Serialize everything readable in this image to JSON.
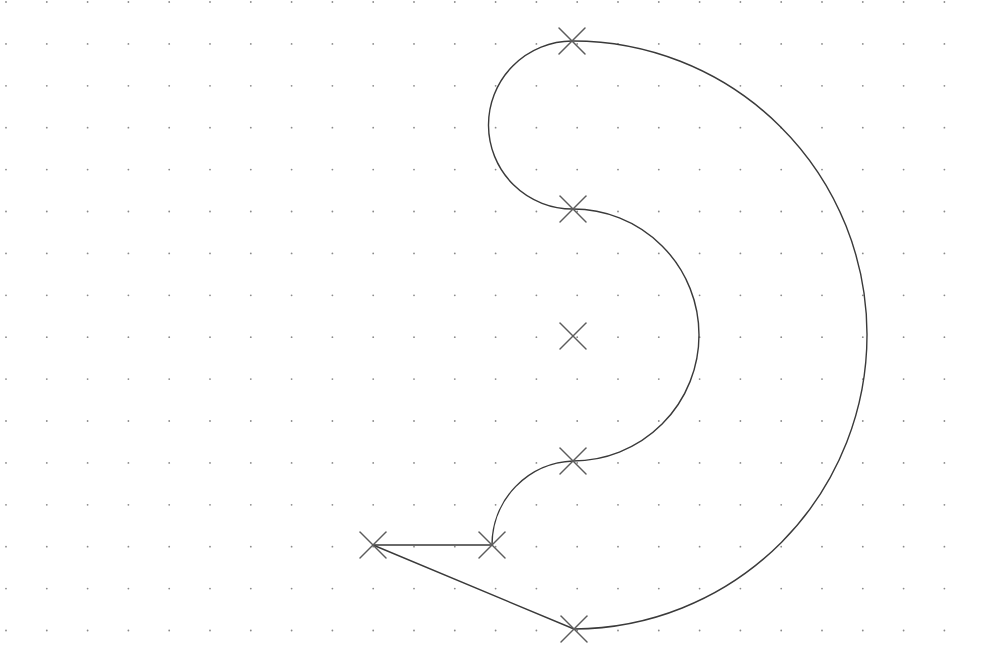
{
  "canvas": {
    "width": 982,
    "height": 666,
    "background": "#ffffff"
  },
  "grid": {
    "origin_x": 6,
    "origin_y": 2,
    "step_x": 40.8,
    "step_y": 41.9,
    "dot_color": "#8a8a8a",
    "dot_radius": 0.9
  },
  "colors": {
    "curve": "#3a3a3a",
    "marker": "#5c5c5c"
  },
  "markers": [
    {
      "id": "top",
      "x": 572,
      "y": 41
    },
    {
      "id": "upper-mid",
      "x": 573,
      "y": 209
    },
    {
      "id": "center",
      "x": 573,
      "y": 336
    },
    {
      "id": "lower-mid",
      "x": 573,
      "y": 461
    },
    {
      "id": "bottom-left-inner",
      "x": 492,
      "y": 545
    },
    {
      "id": "far-left",
      "x": 373,
      "y": 545
    },
    {
      "id": "bottom",
      "x": 574,
      "y": 629
    }
  ],
  "marker_size": 13,
  "segments": [
    {
      "id": "outer-arc",
      "type": "arc",
      "d": "M 572 41 A 294 294 0 0 1 574 629"
    },
    {
      "id": "top-small-arc",
      "type": "arc",
      "d": "M 572 41 A 84 84 0 0 0 573 209"
    },
    {
      "id": "inner-arc",
      "type": "arc",
      "d": "M 573 209 A 126 126 0 0 1 573 461"
    },
    {
      "id": "lower-small-arc",
      "type": "arc",
      "d": "M 573 461 A 84 84 0 0 0 492 545"
    },
    {
      "id": "horizontal-line",
      "type": "line",
      "d": "M 492 545 L 373 545"
    },
    {
      "id": "diagonal-line",
      "type": "line",
      "d": "M 373 545 L 574 629"
    }
  ]
}
